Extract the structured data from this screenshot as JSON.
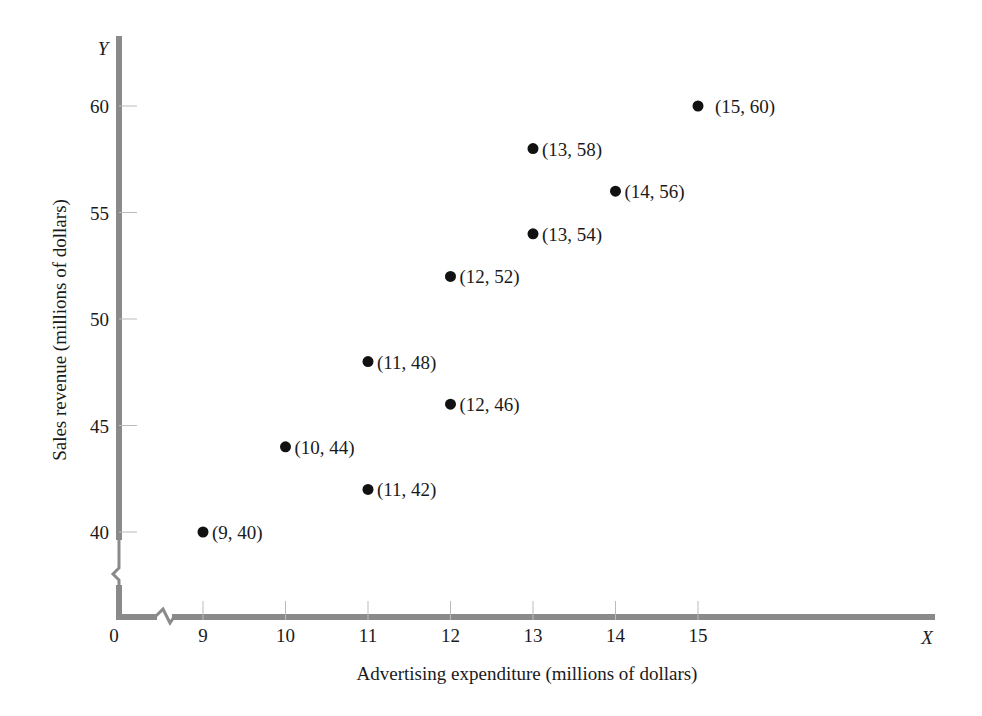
{
  "chart_data": {
    "type": "scatter",
    "title": "",
    "xlabel": "Advertising expenditure (millions of dollars)",
    "ylabel": "Sales revenue (millions of dollars)",
    "x_axis_letter": "X",
    "y_axis_letter": "Y",
    "origin_label": "0",
    "x_ticks": [
      9,
      10,
      11,
      12,
      13,
      14,
      15
    ],
    "y_ticks": [
      40,
      45,
      50,
      55,
      60
    ],
    "xlim": [
      8,
      15
    ],
    "ylim": [
      38,
      60
    ],
    "axis_breaks": true,
    "grid": false,
    "points": [
      {
        "x": 9,
        "y": 40,
        "label": "(9, 40)"
      },
      {
        "x": 10,
        "y": 44,
        "label": "(10, 44)"
      },
      {
        "x": 11,
        "y": 42,
        "label": "(11, 42)"
      },
      {
        "x": 11,
        "y": 48,
        "label": "(11, 48)"
      },
      {
        "x": 12,
        "y": 46,
        "label": "(12, 46)"
      },
      {
        "x": 12,
        "y": 52,
        "label": "(12, 52)"
      },
      {
        "x": 13,
        "y": 54,
        "label": "(13, 54)"
      },
      {
        "x": 13,
        "y": 58,
        "label": "(13, 58)"
      },
      {
        "x": 14,
        "y": 56,
        "label": "(14, 56)"
      },
      {
        "x": 15,
        "y": 60,
        "label": "(15, 60)"
      }
    ]
  },
  "colors": {
    "axis": "#8a8a8a",
    "point": "#111111",
    "text": "#1a1a1a"
  }
}
